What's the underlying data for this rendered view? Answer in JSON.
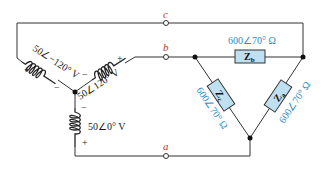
{
  "diagram": {
    "nodes": {
      "a": "a",
      "b": "b",
      "c": "c"
    },
    "sources": [
      {
        "id": "van",
        "label": "50∠0° V",
        "plus": "+",
        "minus": "−"
      },
      {
        "id": "vbn",
        "label": "50∠120° V",
        "plus": "+",
        "minus": "−"
      },
      {
        "id": "vcn",
        "label": "50∠−120° V",
        "plus": "+",
        "minus": "−"
      }
    ],
    "loads": [
      {
        "id": "zb",
        "name": "Z",
        "sub": "b",
        "value": "600∠70° Ω"
      },
      {
        "id": "zc",
        "name": "Z",
        "sub": "c",
        "value": "600∠70° Ω"
      },
      {
        "id": "za",
        "name": "Z",
        "sub": "a",
        "value": "600∠70° Ω"
      }
    ],
    "colors": {
      "wire": "#333333",
      "label_text": "#1a1a1a",
      "load_text": "#2b8cc4",
      "load_fill": "#bfe0f0",
      "node_label": "#c0392b"
    }
  }
}
